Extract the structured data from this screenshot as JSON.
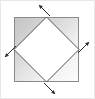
{
  "figure": {
    "canvas": {
      "width": 95,
      "height": 99,
      "background": "#ffffff"
    },
    "image_border": {
      "visible": true,
      "color": "#e8e8e8",
      "width": 1
    },
    "outer_square": {
      "name": "outer-square",
      "x": 14,
      "y": 17,
      "width": 65,
      "height": 65,
      "stroke": "#8a8a8a",
      "stroke_width": 1,
      "fill_top_left": "#c9c9c9",
      "fill_bottom_right": "#fbfbfb",
      "fill_description": "gray gradient, darkest at top-left corner fading to near white at bottom-right"
    },
    "inner_diamond": {
      "name": "inner-diamond",
      "points": "46.5,17 79,49.5 46.5,82 14,49.5",
      "vertices": [
        {
          "label": "top",
          "x": 46.5,
          "y": 17
        },
        {
          "label": "right",
          "x": 79,
          "y": 49.5
        },
        {
          "label": "bottom",
          "x": 46.5,
          "y": 82
        },
        {
          "label": "left",
          "x": 14,
          "y": 49.5
        }
      ],
      "stroke": "#555555",
      "stroke_width": 1,
      "fill": "#ffffff"
    },
    "arrows": [
      {
        "name": "arrow-top",
        "direction": "northwest",
        "from_x": 50,
        "from_y": 16,
        "to_x": 39,
        "to_y": 5,
        "color": "#2b2b2b"
      },
      {
        "name": "arrow-right",
        "direction": "northeast",
        "from_x": 78,
        "from_y": 53,
        "to_x": 89,
        "to_y": 42,
        "color": "#2b2b2b"
      },
      {
        "name": "arrow-bottom",
        "direction": "southeast",
        "from_x": 44,
        "from_y": 83,
        "to_x": 55,
        "to_y": 94,
        "color": "#2b2b2b"
      },
      {
        "name": "arrow-left",
        "direction": "southwest",
        "from_x": 16,
        "from_y": 46,
        "to_x": 5,
        "to_y": 57,
        "color": "#2b2b2b"
      }
    ]
  }
}
